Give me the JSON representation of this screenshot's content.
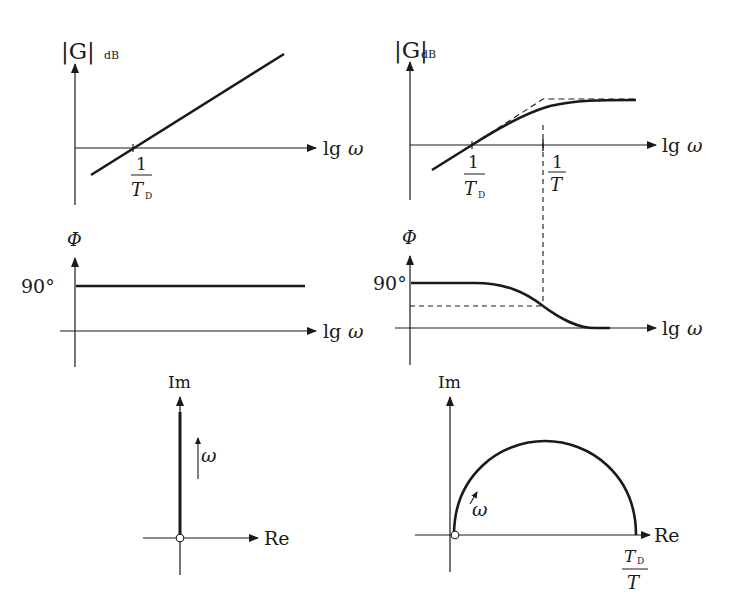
{
  "panels": {
    "top_left": {
      "y_label_main": "|G|",
      "y_label_sub": "dB",
      "x_label_lg": "lg",
      "x_label_omega": "ω",
      "tick_num": "1",
      "tick_den": "T",
      "tick_den_sub": "D"
    },
    "top_right": {
      "y_label_main": "|G|",
      "y_label_sub": "dB",
      "x_label_lg": "lg",
      "x_label_omega": "ω",
      "tick1_num": "1",
      "tick1_den": "T",
      "tick1_den_sub": "D",
      "tick2_num": "1",
      "tick2_den": "T"
    },
    "mid_left": {
      "y_label": "Φ",
      "level_label": "90°",
      "x_label_lg": "lg",
      "x_label_omega": "ω"
    },
    "mid_right": {
      "y_label": "Φ",
      "level_label": "90°",
      "x_label_lg": "lg",
      "x_label_omega": "ω"
    },
    "bottom_left": {
      "y_label": "Im",
      "x_label": "Re",
      "direction_label": "ω"
    },
    "bottom_right": {
      "y_label": "Im",
      "x_label": "Re",
      "direction_label": "ω",
      "endpoint_num": "T",
      "endpoint_num_sub": "D",
      "endpoint_den": "T"
    }
  },
  "colors": {
    "ink": "#1a1a1a",
    "background": "#ffffff"
  }
}
